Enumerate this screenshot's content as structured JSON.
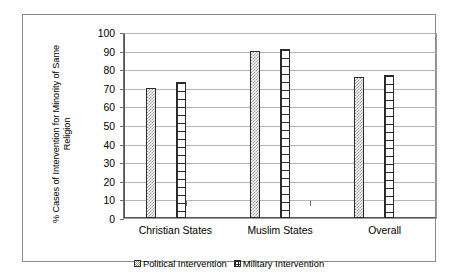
{
  "chart_data": {
    "type": "bar",
    "title": "",
    "xlabel": "",
    "ylabel": "% Cases of Intervention for Minority of Same\nReligion",
    "ylim": [
      0,
      100
    ],
    "yticks": [
      0,
      10,
      20,
      30,
      40,
      50,
      60,
      70,
      80,
      90,
      100
    ],
    "grid": true,
    "legend_position": "bottom",
    "categories": [
      "Christian States",
      "Muslim States",
      "Overall"
    ],
    "series": [
      {
        "name": "Political Intervention",
        "pattern": "stipple",
        "values": [
          70,
          90,
          76
        ]
      },
      {
        "name": "Military Intervention",
        "pattern": "grid",
        "values": [
          73,
          91,
          77
        ]
      }
    ]
  },
  "frame": {
    "border_color": "#8a8a8a",
    "gridline_color": "#b4b4b4",
    "axis_color": "#555555",
    "bar_outline_color": "#2b2b2b"
  }
}
